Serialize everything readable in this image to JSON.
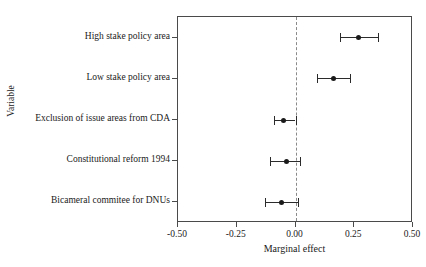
{
  "chart_data": {
    "type": "scatter",
    "title": "",
    "xlabel": "Marginal effect",
    "ylabel": "Variable",
    "xlim": [
      -0.5,
      0.5
    ],
    "grid": false,
    "legend": null,
    "zero_reference_line": 0.0,
    "xticks": [
      -0.5,
      -0.25,
      0.0,
      0.25,
      0.5
    ],
    "xtick_labels": [
      "-0.50",
      "-0.25",
      "0.00",
      "0.25",
      "0.50"
    ],
    "categories": [
      "High stake policy area",
      "Low stake policy area",
      "Exclusion of issue areas from CDA",
      "Constitutional reform 1994",
      "Bicameral commitee for DNUs"
    ],
    "points": [
      {
        "label": "High stake policy area",
        "estimate": 0.27,
        "ci_low": 0.19,
        "ci_high": 0.35
      },
      {
        "label": "Low stake policy area",
        "estimate": 0.16,
        "ci_low": 0.09,
        "ci_high": 0.23
      },
      {
        "label": "Exclusion of issue areas from CDA",
        "estimate": -0.05,
        "ci_low": -0.09,
        "ci_high": 0.0
      },
      {
        "label": "Constitutional reform 1994",
        "estimate": -0.04,
        "ci_low": -0.11,
        "ci_high": 0.02
      },
      {
        "label": "Bicameral commitee for DNUs",
        "estimate": -0.06,
        "ci_low": -0.13,
        "ci_high": 0.01
      }
    ],
    "colors": {
      "point": "#1a1a1a",
      "ci": "#2b2b2b",
      "zero_line": "#8a8a8a",
      "panel_border": "#4a4a4a",
      "background": "#ffffff"
    }
  }
}
